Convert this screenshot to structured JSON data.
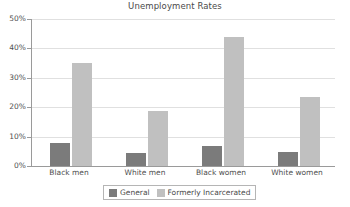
{
  "chart_data": {
    "type": "bar",
    "title": "Unemployment Rates",
    "xlabel": "",
    "ylabel": "",
    "ylim": [
      0,
      50
    ],
    "ytick_labels": [
      "0%",
      "10%",
      "20%",
      "30%",
      "40%",
      "50%"
    ],
    "ytick_values": [
      0,
      10,
      20,
      30,
      40,
      50
    ],
    "grid": true,
    "legend_position": "bottom",
    "categories": [
      "Black men",
      "White men",
      "Black women",
      "White women"
    ],
    "series": [
      {
        "name": "General",
        "color": "#7b7b7b",
        "values": [
          7.7,
          4.5,
          6.8,
          4.8
        ]
      },
      {
        "name": "Formerly Incarcerated",
        "color": "#c0c0c0",
        "values": [
          35.2,
          18.6,
          43.9,
          23.6
        ]
      }
    ]
  },
  "legend": {
    "entries": [
      {
        "label": "General"
      },
      {
        "label": "Formerly Incarcerated"
      }
    ]
  },
  "colors": {
    "general": "#7b7b7b",
    "formerly": "#c0c0c0",
    "grid": "#e0e0e0",
    "axis": "#9a9a9a",
    "text": "#4a4a4a",
    "background": "#ffffff"
  }
}
